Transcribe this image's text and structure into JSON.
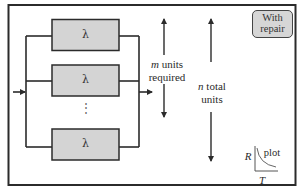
{
  "diagram": {
    "type": "parallel-redundancy-block-diagram",
    "blocks": [
      {
        "label": "λ"
      },
      {
        "label": "λ"
      },
      {
        "label": "λ"
      }
    ],
    "ellipsis": "⋮",
    "m_label": {
      "var": "m",
      "line1_rest": " units",
      "line2": "required"
    },
    "n_label": {
      "var": "n",
      "line1_rest": " total",
      "line2": "units"
    },
    "badge": {
      "line1": "With",
      "line2": "repair"
    },
    "plot_icon": {
      "y_axis": "R",
      "x_axis": "T",
      "label": "plot"
    },
    "colors": {
      "block_fill": "#d4d4d4",
      "line": "#2b2b2b",
      "badge_fill": "#d6d6d6",
      "background": "#ffffff"
    }
  }
}
